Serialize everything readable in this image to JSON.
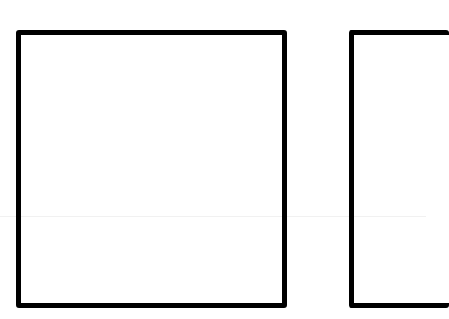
{
  "canvas": {
    "width": 426,
    "height": 319,
    "background": "#ffffff"
  },
  "shapes": [
    {
      "id": "box-1",
      "type": "rectangle",
      "stroke": "#000000",
      "stroke_width": 5,
      "fill": "none",
      "x": 16,
      "y": 30,
      "width": 271,
      "height": 278
    },
    {
      "id": "box-2",
      "type": "rectangle",
      "stroke": "#000000",
      "stroke_width": 5,
      "fill": "none",
      "x": 349,
      "y": 30,
      "width_visible": 77,
      "height": 278,
      "clipped": "right"
    }
  ]
}
